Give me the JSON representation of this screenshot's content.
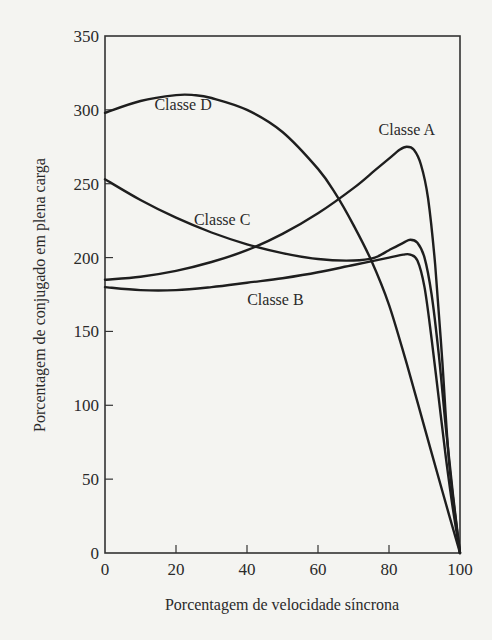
{
  "chart_data": {
    "type": "line",
    "title": "",
    "xlabel": "Porcentagem de velocidade síncrona",
    "ylabel": "Porcentagem de conjugado em plena carga",
    "xlim": [
      0,
      100
    ],
    "ylim": [
      0,
      350
    ],
    "xticks": [
      0,
      20,
      40,
      60,
      80,
      100
    ],
    "yticks": [
      0,
      50,
      100,
      150,
      200,
      250,
      300,
      350
    ],
    "grid": false,
    "legend": "inline labels",
    "series": [
      {
        "name": "Classe A",
        "label_pos": [
          85,
          283
        ],
        "x": [
          0,
          10,
          20,
          30,
          40,
          50,
          60,
          70,
          76,
          80,
          83,
          85,
          87,
          89,
          91,
          93,
          95,
          97,
          100
        ],
        "y": [
          185,
          187,
          191,
          197,
          205,
          216,
          230,
          247,
          259,
          267,
          273,
          275,
          273,
          263,
          240,
          195,
          130,
          60,
          0
        ]
      },
      {
        "name": "Classe B",
        "label_pos": [
          48,
          168
        ],
        "x": [
          0,
          10,
          20,
          30,
          40,
          50,
          60,
          70,
          80,
          84,
          86,
          88,
          90,
          92,
          94,
          96,
          98,
          100
        ],
        "y": [
          180,
          178,
          178,
          180,
          183,
          186,
          190,
          195,
          200,
          202,
          202,
          198,
          180,
          145,
          105,
          65,
          30,
          0
        ]
      },
      {
        "name": "Classe C",
        "label_pos": [
          33,
          222
        ],
        "x": [
          0,
          10,
          20,
          30,
          40,
          50,
          60,
          70,
          76,
          80,
          84,
          86,
          88,
          90,
          92,
          94,
          96,
          98,
          100
        ],
        "y": [
          253,
          239,
          227,
          217,
          209,
          203,
          199,
          198,
          200,
          205,
          210,
          212,
          210,
          200,
          175,
          135,
          85,
          40,
          0
        ]
      },
      {
        "name": "Classe D",
        "label_pos": [
          22,
          300
        ],
        "x": [
          0,
          10,
          20,
          25,
          30,
          40,
          50,
          60,
          65,
          70,
          75,
          80,
          85,
          90,
          95,
          100
        ],
        "y": [
          298,
          306,
          310,
          310,
          308,
          300,
          285,
          260,
          243,
          222,
          198,
          168,
          128,
          85,
          42,
          0
        ]
      }
    ]
  },
  "axes": {
    "x_title": "Porcentagem de velocidade síncrona",
    "y_title": "Porcentagem de conjugado em plena carga"
  }
}
